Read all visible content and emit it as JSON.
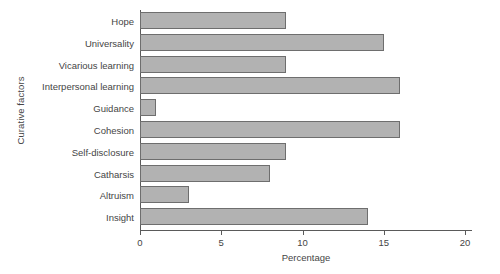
{
  "chart_data": {
    "type": "bar",
    "orientation": "horizontal",
    "title": "",
    "xlabel": "Percentage",
    "ylabel": "Curative factors",
    "categories": [
      "Hope",
      "Universality",
      "Vicarious learning",
      "Interpersonal learning",
      "Guidance",
      "Cohesion",
      "Self-disclosure",
      "Catharsis",
      "Altruism",
      "Insight"
    ],
    "values": [
      9,
      15,
      9,
      16,
      1,
      16,
      9,
      8,
      3,
      14
    ],
    "xlim": [
      0,
      20
    ],
    "xticks": [
      0,
      5,
      10,
      15,
      20
    ],
    "xtick_labels": [
      "0",
      "5",
      "10",
      "15",
      "20"
    ],
    "grid": false,
    "legend": null,
    "bar_fill_color": "#b2b2b2",
    "bar_edge_color": "#6e6e6e",
    "axis_color": "#5a5a5a",
    "background_color": "#ffffff"
  }
}
